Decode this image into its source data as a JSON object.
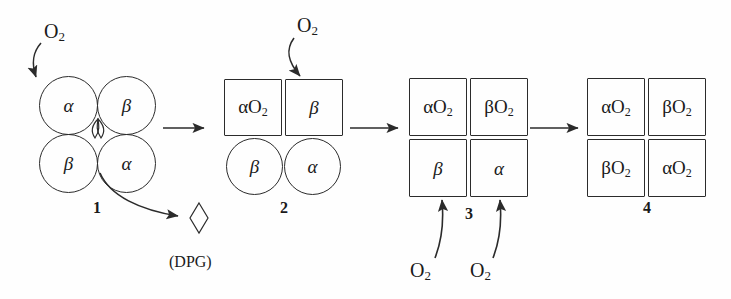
{
  "figure": {
    "background_color": "#fefefe",
    "line_color": "#2b2b2b"
  },
  "labels": {
    "o2": "O",
    "o2_sub": "2",
    "dpg": "(DPG)"
  },
  "states": [
    {
      "number": "1",
      "shape": "circle",
      "subunits": [
        {
          "id": "top-left",
          "base": "α",
          "oxygenated": false,
          "text": "α"
        },
        {
          "id": "top-right",
          "base": "β",
          "oxygenated": false,
          "text": "β"
        },
        {
          "id": "bottom-left",
          "base": "β",
          "oxygenated": false,
          "text": "β"
        },
        {
          "id": "bottom-right",
          "base": "α",
          "oxygenated": false,
          "text": "α"
        }
      ],
      "has_dpg_cavity": true
    },
    {
      "number": "2",
      "shape": "mixed",
      "subunits": [
        {
          "id": "top-left",
          "base": "α",
          "oxygenated": true,
          "text": "αO",
          "shape": "square"
        },
        {
          "id": "top-right",
          "base": "β",
          "oxygenated": false,
          "text": "β",
          "shape": "square"
        },
        {
          "id": "bottom-left",
          "base": "β",
          "oxygenated": false,
          "text": "β",
          "shape": "circle"
        },
        {
          "id": "bottom-right",
          "base": "α",
          "oxygenated": false,
          "text": "α",
          "shape": "circle"
        }
      ],
      "has_dpg_cavity": false
    },
    {
      "number": "3",
      "shape": "square",
      "subunits": [
        {
          "id": "top-left",
          "base": "α",
          "oxygenated": true,
          "text": "αO"
        },
        {
          "id": "top-right",
          "base": "β",
          "oxygenated": true,
          "text": "βO"
        },
        {
          "id": "bottom-left",
          "base": "β",
          "oxygenated": false,
          "text": "β"
        },
        {
          "id": "bottom-right",
          "base": "α",
          "oxygenated": false,
          "text": "α"
        }
      ],
      "has_dpg_cavity": false
    },
    {
      "number": "4",
      "shape": "square",
      "subunits": [
        {
          "id": "top-left",
          "base": "α",
          "oxygenated": true,
          "text": "αO"
        },
        {
          "id": "top-right",
          "base": "β",
          "oxygenated": true,
          "text": "βO"
        },
        {
          "id": "bottom-left",
          "base": "β",
          "oxygenated": true,
          "text": "βO"
        },
        {
          "id": "bottom-right",
          "base": "α",
          "oxygenated": true,
          "text": "αO"
        }
      ],
      "has_dpg_cavity": false
    }
  ],
  "o2_inputs": [
    {
      "id": "o2-to-state1",
      "target_state": "1",
      "target_subunit": "top-left",
      "label": "O",
      "sub": "2",
      "direction": "down-right"
    },
    {
      "id": "o2-to-state2",
      "target_state": "2",
      "target_subunit": "top-right",
      "label": "O",
      "sub": "2",
      "direction": "down-right"
    },
    {
      "id": "o2-to-state3-left",
      "target_state": "3",
      "target_subunit": "bottom-left",
      "label": "O",
      "sub": "2",
      "direction": "up"
    },
    {
      "id": "o2-to-state3-right",
      "target_state": "3",
      "target_subunit": "bottom-right",
      "label": "O",
      "sub": "2",
      "direction": "up"
    }
  ],
  "dpg_release": {
    "from_state": "1",
    "label": "(DPG)",
    "shape": "diamond"
  },
  "reaction_arrows": [
    {
      "id": "arrow-1-2",
      "from": "1",
      "to": "2"
    },
    {
      "id": "arrow-2-3",
      "from": "2",
      "to": "3"
    },
    {
      "id": "arrow-3-4",
      "from": "3",
      "to": "4"
    }
  ]
}
